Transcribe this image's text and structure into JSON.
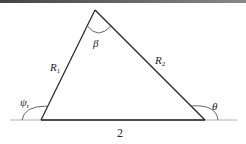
{
  "diagram": {
    "type": "triangle-geometry",
    "vertices": {
      "apex": [
        95,
        10
      ],
      "left": [
        41,
        120
      ],
      "right": [
        205,
        120
      ]
    },
    "baseline": {
      "x1": 10,
      "x2": 237,
      "y": 120
    },
    "labels": {
      "beta": "β",
      "r1_main": "R",
      "r1_sub": "1",
      "r2_main": "R",
      "r2_sub": "2",
      "psi_main": "ψ",
      "psi_sub": "r",
      "theta": "θ",
      "base_length": "2"
    },
    "colors": {
      "line": "#222222",
      "baseline": "#aaaaaa",
      "arc": "#555555"
    }
  }
}
